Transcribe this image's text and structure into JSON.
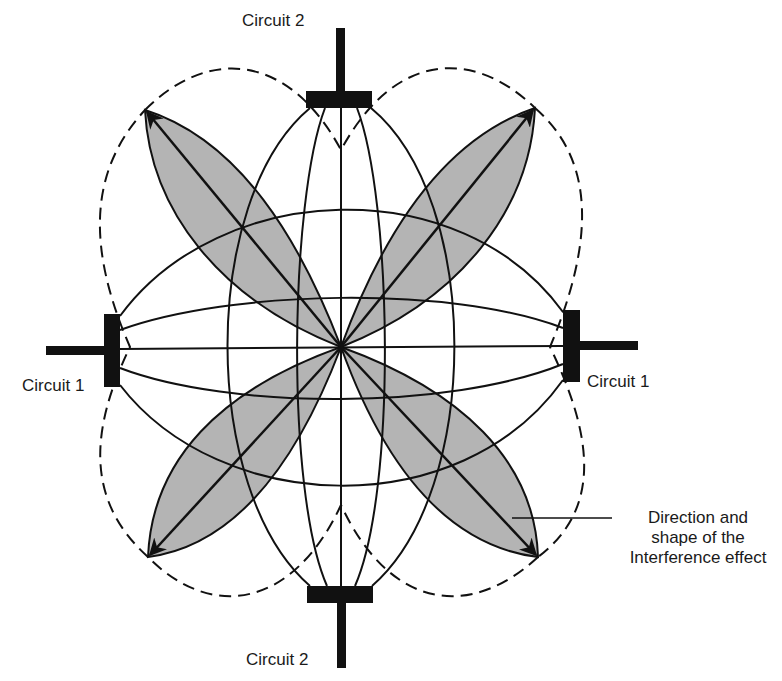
{
  "diagram": {
    "labels": {
      "circuit2_top": "Circuit 2",
      "circuit2_bottom": "Circuit 2",
      "circuit1_left": "Circuit 1",
      "circuit1_right": "Circuit 1"
    },
    "callout": {
      "line1": "Direction and",
      "line2": "shape of the",
      "line3": "Interference effect"
    },
    "colors": {
      "ink": "#111111",
      "petal_fill": "#b4b4b4",
      "background": "#ffffff"
    },
    "petals": [
      {
        "name": "upper-left",
        "direction": "northwest"
      },
      {
        "name": "upper-right",
        "direction": "northeast"
      },
      {
        "name": "lower-left",
        "direction": "southwest"
      },
      {
        "name": "lower-right",
        "direction": "southeast"
      }
    ]
  }
}
